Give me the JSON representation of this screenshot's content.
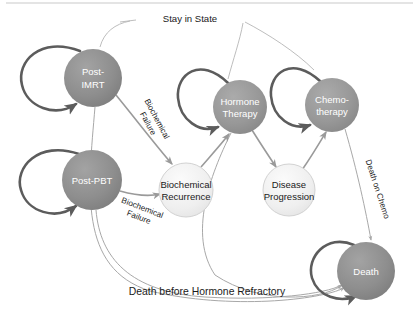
{
  "diagram": {
    "type": "state-transition-diagram",
    "canvas": {
      "width": 419,
      "height": 317,
      "background": "#ffffff"
    },
    "palette": {
      "node_dark_gray": "#8a8a8a",
      "node_mid_gray": "#9a9a9a",
      "node_light_gray": "#ededed",
      "node_light_stroke": "#cfcfcf",
      "arrow_dark": "#5c5c5c",
      "arrow_light": "#a8a8a8",
      "label_dark": "#1a1a1a",
      "label_light": "#ffffff"
    },
    "nodes": [
      {
        "id": "post-imrt",
        "lines": [
          "Post-",
          "IMRT"
        ],
        "cx": 93,
        "cy": 78,
        "r": 29,
        "fill": "#8e8e8e",
        "stroke": "none",
        "text_color": "#ffffff",
        "self_loop": true
      },
      {
        "id": "post-pbt",
        "lines": [
          "Post-PBT"
        ],
        "cx": 92,
        "cy": 180,
        "r": 30,
        "fill": "#8a8a8a",
        "stroke": "none",
        "text_color": "#ffffff",
        "self_loop": true
      },
      {
        "id": "hormone-therapy",
        "lines": [
          "Hormone",
          "Therapy"
        ],
        "cx": 240,
        "cy": 107,
        "r": 27,
        "fill": "#979797",
        "stroke": "none",
        "text_color": "#ffffff",
        "self_loop": true
      },
      {
        "id": "chemotherapy",
        "lines": [
          "Chemo-",
          "therapy"
        ],
        "cx": 332,
        "cy": 105,
        "r": 27,
        "fill": "#979797",
        "stroke": "none",
        "text_color": "#ffffff",
        "self_loop": true
      },
      {
        "id": "biochemical-recurrence",
        "lines": [
          "Biochemical",
          "Recurrence"
        ],
        "cx": 186,
        "cy": 190,
        "r": 27,
        "fill": "#efefef",
        "stroke": "#d0d0d0",
        "text_color": "#1a1a1a",
        "self_loop": false
      },
      {
        "id": "disease-progression",
        "lines": [
          "Disease",
          "Progression"
        ],
        "cx": 289,
        "cy": 190,
        "r": 26,
        "fill": "#efefef",
        "stroke": "#d0d0d0",
        "text_color": "#1a1a1a",
        "self_loop": false
      },
      {
        "id": "death",
        "lines": [
          "Death"
        ],
        "cx": 366,
        "cy": 271,
        "r": 29,
        "fill": "#8e8e8e",
        "stroke": "none",
        "text_color": "#ffffff",
        "self_loop": true
      }
    ],
    "edge_labels": [
      {
        "id": "stay-in-state",
        "text": "Stay in State",
        "x": 190,
        "y": 20,
        "rotate": 0,
        "size": 9.5
      },
      {
        "id": "biochemical-failure-imrt",
        "text_lines": [
          "Biochemical",
          "Failure"
        ],
        "x": 151,
        "y": 122,
        "rotate": 62,
        "size": 8.4
      },
      {
        "id": "biochemical-failure-pbt",
        "text_lines": [
          "Biochemical",
          "Failure"
        ],
        "x": 140,
        "y": 214,
        "rotate": 21,
        "size": 8.4
      },
      {
        "id": "death-on-chemo",
        "text": "Death on Chemo",
        "x": 375,
        "y": 190,
        "rotate": 72,
        "size": 8.6
      },
      {
        "id": "death-before-hormone-refractory",
        "text": "Death before Hormone Refractory",
        "x": 207,
        "y": 293,
        "rotate": 0,
        "size": 10
      }
    ],
    "transitions": [
      {
        "from": "post-imrt",
        "to": "post-imrt",
        "label": "Stay in State"
      },
      {
        "from": "post-pbt",
        "to": "post-pbt",
        "label": "Stay in State"
      },
      {
        "from": "hormone-therapy",
        "to": "hormone-therapy",
        "label": "Stay in State"
      },
      {
        "from": "chemotherapy",
        "to": "chemotherapy",
        "label": "Stay in State"
      },
      {
        "from": "death",
        "to": "death",
        "label": "Stay in State"
      },
      {
        "from": "post-imrt",
        "to": "biochemical-recurrence",
        "label": "Biochemical Failure"
      },
      {
        "from": "post-pbt",
        "to": "biochemical-recurrence",
        "label": "Biochemical Failure"
      },
      {
        "from": "biochemical-recurrence",
        "to": "hormone-therapy",
        "label": ""
      },
      {
        "from": "hormone-therapy",
        "to": "disease-progression",
        "label": ""
      },
      {
        "from": "disease-progression",
        "to": "chemotherapy",
        "label": ""
      },
      {
        "from": "chemotherapy",
        "to": "death",
        "label": "Death on Chemo"
      },
      {
        "from": "post-imrt",
        "to": "death",
        "label": "Death before Hormone Refractory"
      },
      {
        "from": "post-pbt",
        "to": "death",
        "label": "Death before Hormone Refractory"
      },
      {
        "from": "hormone-therapy",
        "to": "death",
        "label": "Death before Hormone Refractory"
      }
    ]
  }
}
